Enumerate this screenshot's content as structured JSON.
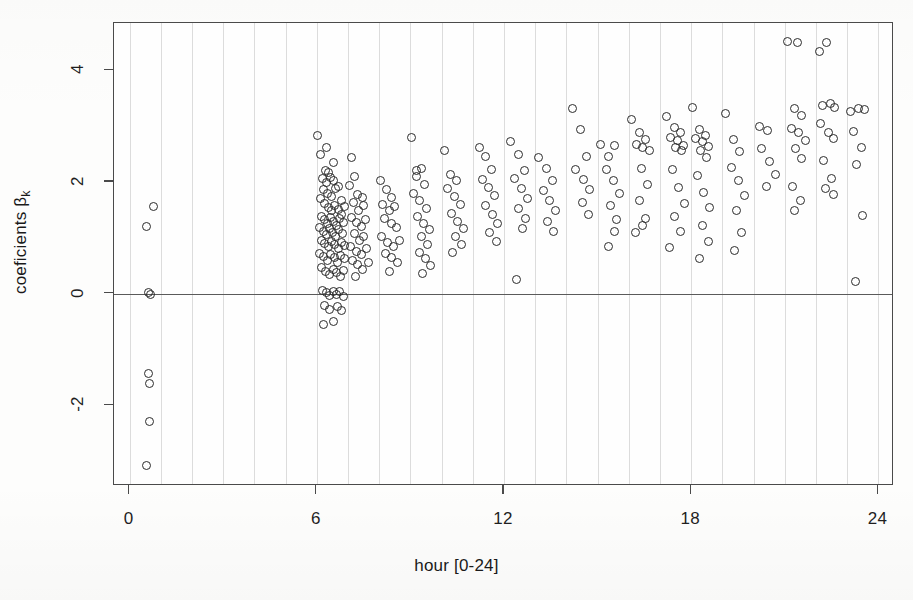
{
  "figure": {
    "background_color": "#fdfdfc",
    "axis_color": "#4a4a4a",
    "grid_color": "#dcdcdc",
    "point_color": "#2b2b2b"
  },
  "chart_data": {
    "type": "scatter",
    "title": "",
    "xlabel": "hour [0-24]",
    "ylabel": "coeficients β",
    "ylabel_subscript": "k",
    "xlim": [
      -0.5,
      24.5
    ],
    "ylim": [
      -3.45,
      4.85
    ],
    "xticks": [
      0,
      6,
      12,
      18,
      24
    ],
    "xticklabels": [
      "0",
      "6",
      "12",
      "18",
      "24"
    ],
    "yticks": [
      -2,
      0,
      2,
      4
    ],
    "yticklabels": [
      "-2",
      "0",
      "2",
      "4"
    ],
    "grid": "vertical-hourly",
    "gridlines_x": [
      0,
      1,
      2,
      3,
      4,
      5,
      6,
      7,
      8,
      9,
      10,
      11,
      12,
      13,
      14,
      15,
      16,
      17,
      18,
      19,
      20,
      21,
      22,
      23,
      24
    ],
    "reference_line_y": 0,
    "marker": "open-circle",
    "marker_size_px": 9,
    "legend": "none",
    "n_points": 248,
    "points": [
      [
        0.55,
        1.2
      ],
      [
        0.75,
        1.56
      ],
      [
        0.6,
        0.02
      ],
      [
        0.66,
        -0.02
      ],
      [
        0.62,
        -1.44
      ],
      [
        0.64,
        -1.62
      ],
      [
        0.63,
        -2.3
      ],
      [
        0.55,
        -3.08
      ],
      [
        6.02,
        2.83
      ],
      [
        6.12,
        2.5
      ],
      [
        6.3,
        2.62
      ],
      [
        6.52,
        2.35
      ],
      [
        6.28,
        2.2
      ],
      [
        6.38,
        2.17
      ],
      [
        6.18,
        2.06
      ],
      [
        6.3,
        1.99
      ],
      [
        6.44,
        2.08
      ],
      [
        6.55,
        2.02
      ],
      [
        6.22,
        1.86
      ],
      [
        6.33,
        1.8
      ],
      [
        6.46,
        1.74
      ],
      [
        6.6,
        1.88
      ],
      [
        6.7,
        1.92
      ],
      [
        6.8,
        1.66
      ],
      [
        6.12,
        1.7
      ],
      [
        6.24,
        1.62
      ],
      [
        6.36,
        1.55
      ],
      [
        6.48,
        1.48
      ],
      [
        6.58,
        1.58
      ],
      [
        6.68,
        1.5
      ],
      [
        6.78,
        1.42
      ],
      [
        6.88,
        1.56
      ],
      [
        6.16,
        1.38
      ],
      [
        6.26,
        1.32
      ],
      [
        6.35,
        1.26
      ],
      [
        6.45,
        1.36
      ],
      [
        6.55,
        1.3
      ],
      [
        6.64,
        1.22
      ],
      [
        6.74,
        1.34
      ],
      [
        6.84,
        1.28
      ],
      [
        6.1,
        1.18
      ],
      [
        6.2,
        1.12
      ],
      [
        6.3,
        1.06
      ],
      [
        6.4,
        1.16
      ],
      [
        6.5,
        1.1
      ],
      [
        6.6,
        1.02
      ],
      [
        6.7,
        1.14
      ],
      [
        6.82,
        1.08
      ],
      [
        6.14,
        0.96
      ],
      [
        6.25,
        0.9
      ],
      [
        6.36,
        0.84
      ],
      [
        6.47,
        0.94
      ],
      [
        6.58,
        0.88
      ],
      [
        6.68,
        0.8
      ],
      [
        6.78,
        0.92
      ],
      [
        6.9,
        0.86
      ],
      [
        6.08,
        0.72
      ],
      [
        6.2,
        0.66
      ],
      [
        6.33,
        0.6
      ],
      [
        6.45,
        0.7
      ],
      [
        6.56,
        0.64
      ],
      [
        6.66,
        0.56
      ],
      [
        6.76,
        0.68
      ],
      [
        6.88,
        0.62
      ],
      [
        6.15,
        0.46
      ],
      [
        6.28,
        0.4
      ],
      [
        6.4,
        0.34
      ],
      [
        6.52,
        0.44
      ],
      [
        6.64,
        0.38
      ],
      [
        6.76,
        0.3
      ],
      [
        6.86,
        0.42
      ],
      [
        6.18,
        0.06
      ],
      [
        6.3,
        0.01
      ],
      [
        6.42,
        -0.04
      ],
      [
        6.54,
        0.03
      ],
      [
        6.64,
        -0.02
      ],
      [
        6.74,
        0.04
      ],
      [
        6.84,
        -0.05
      ],
      [
        6.26,
        -0.22
      ],
      [
        6.4,
        -0.28
      ],
      [
        6.66,
        -0.24
      ],
      [
        6.78,
        -0.3
      ],
      [
        6.22,
        -0.55
      ],
      [
        6.52,
        -0.5
      ],
      [
        7.1,
        2.44
      ],
      [
        7.22,
        2.1
      ],
      [
        7.05,
        1.94
      ],
      [
        7.3,
        1.78
      ],
      [
        7.45,
        1.72
      ],
      [
        7.18,
        1.64
      ],
      [
        7.34,
        1.48
      ],
      [
        7.5,
        1.58
      ],
      [
        7.12,
        1.36
      ],
      [
        7.28,
        1.28
      ],
      [
        7.42,
        1.2
      ],
      [
        7.56,
        1.32
      ],
      [
        7.2,
        1.08
      ],
      [
        7.36,
        0.96
      ],
      [
        7.5,
        1.02
      ],
      [
        7.08,
        0.84
      ],
      [
        7.26,
        0.76
      ],
      [
        7.44,
        0.7
      ],
      [
        7.6,
        0.8
      ],
      [
        7.16,
        0.6
      ],
      [
        7.32,
        0.52
      ],
      [
        7.48,
        0.44
      ],
      [
        7.66,
        0.56
      ],
      [
        7.24,
        0.3
      ],
      [
        8.05,
        2.02
      ],
      [
        8.22,
        1.86
      ],
      [
        8.4,
        1.72
      ],
      [
        8.12,
        1.6
      ],
      [
        8.32,
        1.48
      ],
      [
        8.5,
        1.56
      ],
      [
        8.18,
        1.34
      ],
      [
        8.38,
        1.26
      ],
      [
        8.56,
        1.18
      ],
      [
        8.08,
        1.02
      ],
      [
        8.28,
        0.92
      ],
      [
        8.46,
        0.84
      ],
      [
        8.64,
        0.96
      ],
      [
        8.2,
        0.72
      ],
      [
        8.4,
        0.64
      ],
      [
        8.58,
        0.56
      ],
      [
        8.34,
        0.4
      ],
      [
        9.02,
        2.8
      ],
      [
        9.2,
        2.2
      ],
      [
        9.35,
        2.24
      ],
      [
        9.18,
        2.1
      ],
      [
        9.44,
        1.96
      ],
      [
        9.1,
        1.8
      ],
      [
        9.3,
        1.66
      ],
      [
        9.5,
        1.52
      ],
      [
        9.22,
        1.38
      ],
      [
        9.42,
        1.26
      ],
      [
        9.6,
        1.14
      ],
      [
        9.35,
        1.02
      ],
      [
        9.55,
        0.88
      ],
      [
        9.28,
        0.74
      ],
      [
        9.48,
        0.62
      ],
      [
        9.66,
        0.5
      ],
      [
        9.4,
        0.36
      ],
      [
        10.1,
        2.56
      ],
      [
        10.3,
        2.14
      ],
      [
        10.48,
        2.02
      ],
      [
        10.2,
        1.88
      ],
      [
        10.4,
        1.74
      ],
      [
        10.6,
        1.6
      ],
      [
        10.32,
        1.44
      ],
      [
        10.52,
        1.3
      ],
      [
        10.7,
        1.16
      ],
      [
        10.44,
        1.02
      ],
      [
        10.64,
        0.88
      ],
      [
        10.36,
        0.74
      ],
      [
        11.2,
        2.62
      ],
      [
        11.4,
        2.46
      ],
      [
        11.6,
        2.22
      ],
      [
        11.3,
        2.04
      ],
      [
        11.5,
        1.9
      ],
      [
        11.7,
        1.76
      ],
      [
        11.42,
        1.58
      ],
      [
        11.62,
        1.42
      ],
      [
        11.8,
        1.26
      ],
      [
        11.55,
        1.1
      ],
      [
        11.75,
        0.94
      ],
      [
        12.2,
        2.72
      ],
      [
        12.45,
        2.5
      ],
      [
        12.65,
        2.2
      ],
      [
        12.35,
        2.06
      ],
      [
        12.55,
        1.88
      ],
      [
        12.75,
        1.7
      ],
      [
        12.48,
        1.52
      ],
      [
        12.68,
        1.34
      ],
      [
        12.6,
        1.16
      ],
      [
        12.4,
        0.26
      ],
      [
        13.1,
        2.44
      ],
      [
        13.35,
        2.24
      ],
      [
        13.55,
        2.02
      ],
      [
        13.25,
        1.84
      ],
      [
        13.45,
        1.66
      ],
      [
        13.65,
        1.48
      ],
      [
        13.4,
        1.3
      ],
      [
        13.6,
        1.12
      ],
      [
        14.2,
        3.32
      ],
      [
        14.45,
        2.94
      ],
      [
        14.65,
        2.46
      ],
      [
        14.3,
        2.22
      ],
      [
        14.55,
        2.04
      ],
      [
        14.75,
        1.86
      ],
      [
        14.5,
        1.64
      ],
      [
        14.7,
        1.42
      ],
      [
        15.1,
        2.68
      ],
      [
        15.35,
        2.46
      ],
      [
        15.55,
        2.66
      ],
      [
        15.28,
        2.22
      ],
      [
        15.5,
        2.02
      ],
      [
        15.7,
        1.8
      ],
      [
        15.42,
        1.58
      ],
      [
        15.62,
        1.32
      ],
      [
        15.55,
        1.12
      ],
      [
        15.35,
        0.84
      ],
      [
        16.1,
        3.12
      ],
      [
        16.35,
        2.88
      ],
      [
        16.55,
        2.76
      ],
      [
        16.25,
        2.68
      ],
      [
        16.45,
        2.62
      ],
      [
        16.65,
        2.56
      ],
      [
        16.4,
        2.24
      ],
      [
        16.6,
        1.96
      ],
      [
        16.35,
        1.66
      ],
      [
        16.55,
        1.34
      ],
      [
        16.45,
        1.22
      ],
      [
        16.2,
        1.1
      ],
      [
        17.2,
        3.18
      ],
      [
        17.45,
        2.98
      ],
      [
        17.65,
        2.88
      ],
      [
        17.35,
        2.8
      ],
      [
        17.55,
        2.74
      ],
      [
        17.75,
        2.66
      ],
      [
        17.5,
        2.62
      ],
      [
        17.7,
        2.56
      ],
      [
        17.4,
        2.22
      ],
      [
        17.6,
        1.9
      ],
      [
        17.8,
        1.62
      ],
      [
        17.45,
        1.38
      ],
      [
        17.65,
        1.12
      ],
      [
        17.3,
        0.82
      ],
      [
        18.05,
        3.34
      ],
      [
        18.25,
        2.94
      ],
      [
        18.45,
        2.84
      ],
      [
        18.15,
        2.78
      ],
      [
        18.35,
        2.72
      ],
      [
        18.55,
        2.64
      ],
      [
        18.3,
        2.56
      ],
      [
        18.5,
        2.44
      ],
      [
        18.2,
        2.12
      ],
      [
        18.4,
        1.82
      ],
      [
        18.6,
        1.54
      ],
      [
        18.35,
        1.22
      ],
      [
        18.55,
        0.94
      ],
      [
        18.25,
        0.62
      ],
      [
        19.1,
        3.22
      ],
      [
        19.35,
        2.76
      ],
      [
        19.55,
        2.54
      ],
      [
        19.3,
        2.26
      ],
      [
        19.5,
        2.02
      ],
      [
        19.7,
        1.76
      ],
      [
        19.45,
        1.48
      ],
      [
        19.6,
        1.1
      ],
      [
        19.4,
        0.78
      ],
      [
        20.2,
        3.0
      ],
      [
        20.45,
        2.92
      ],
      [
        20.25,
        2.6
      ],
      [
        20.5,
        2.36
      ],
      [
        20.7,
        2.14
      ],
      [
        20.4,
        1.92
      ],
      [
        21.1,
        4.52
      ],
      [
        21.4,
        4.5
      ],
      [
        21.3,
        3.32
      ],
      [
        21.55,
        3.2
      ],
      [
        21.2,
        2.96
      ],
      [
        21.45,
        2.88
      ],
      [
        21.65,
        2.74
      ],
      [
        21.35,
        2.6
      ],
      [
        21.55,
        2.42
      ],
      [
        21.25,
        1.92
      ],
      [
        21.5,
        1.66
      ],
      [
        21.3,
        1.48
      ],
      [
        22.1,
        4.34
      ],
      [
        22.35,
        4.5
      ],
      [
        22.2,
        3.38
      ],
      [
        22.45,
        3.4
      ],
      [
        22.6,
        3.34
      ],
      [
        22.15,
        3.04
      ],
      [
        22.4,
        2.88
      ],
      [
        22.55,
        2.78
      ],
      [
        22.25,
        2.38
      ],
      [
        22.5,
        2.06
      ],
      [
        22.3,
        1.88
      ],
      [
        22.55,
        1.78
      ],
      [
        23.1,
        3.26
      ],
      [
        23.35,
        3.32
      ],
      [
        23.55,
        3.3
      ],
      [
        23.2,
        2.9
      ],
      [
        23.45,
        2.62
      ],
      [
        23.3,
        2.32
      ],
      [
        23.5,
        1.4
      ],
      [
        23.25,
        0.22
      ]
    ]
  }
}
